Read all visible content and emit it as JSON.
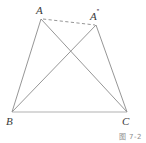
{
  "figure": {
    "type": "geometry-diagram",
    "caption": "图 7-2",
    "background_color": "#ffffff",
    "line_color": "#8a8a8a",
    "label_color": "#3a3a3a",
    "vertices": [
      {
        "id": "A",
        "label": "A",
        "prime": "",
        "x": 41,
        "y": 19
      },
      {
        "id": "A2",
        "label": "A",
        "prime": "''",
        "x": 96,
        "y": 25
      },
      {
        "id": "B",
        "label": "B",
        "prime": "",
        "x": 12,
        "y": 112
      },
      {
        "id": "C",
        "label": "C",
        "prime": "",
        "x": 127,
        "y": 112
      }
    ],
    "segments": [
      {
        "id": "AB",
        "from": "A",
        "to": "B",
        "style": "solid"
      },
      {
        "id": "AC",
        "from": "A",
        "to": "C",
        "style": "solid"
      },
      {
        "id": "A2B",
        "from": "A2",
        "to": "B",
        "style": "solid"
      },
      {
        "id": "A2C",
        "from": "A2",
        "to": "C",
        "style": "solid"
      },
      {
        "id": "BC",
        "from": "B",
        "to": "C",
        "style": "solid"
      },
      {
        "id": "AA2",
        "from": "A",
        "to": "A2",
        "style": "dashed"
      }
    ],
    "intersection": {
      "id": "AC-x-A2B",
      "x": 66,
      "y": 48
    }
  }
}
